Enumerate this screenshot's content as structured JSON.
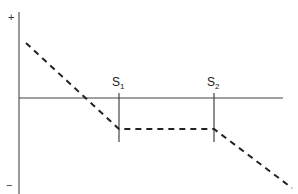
{
  "chart_data": {
    "type": "line",
    "title": "",
    "xlabel": "",
    "ylabel": "",
    "y_axis_marks": {
      "top": "+",
      "bottom": "−"
    },
    "annotations": [
      {
        "label": "S",
        "subscript": "1",
        "x": 119
      },
      {
        "label": "S",
        "subscript": "2",
        "x": 214
      }
    ],
    "series": [
      {
        "name": "payoff",
        "style": "dashed",
        "color": "#222222",
        "points": [
          {
            "x": 26,
            "y": 43
          },
          {
            "x": 119,
            "y": 129
          },
          {
            "x": 214,
            "y": 129
          },
          {
            "x": 292,
            "y": 188
          }
        ]
      }
    ],
    "axes": {
      "x_axis_y": 98,
      "y_axis_x": 19,
      "color": "#444444"
    },
    "grid": false,
    "legend": false
  },
  "labels": {
    "plus": "+",
    "minus": "−",
    "s1_main": "S",
    "s1_sub": "1",
    "s2_main": "S",
    "s2_sub": "2"
  }
}
